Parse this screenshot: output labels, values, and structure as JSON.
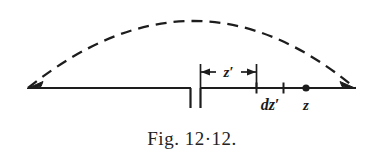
{
  "figure": {
    "caption": "Fig. 12·12.",
    "ink_color": "#1d1d1d",
    "background_color": "#ffffff",
    "labels": {
      "dimension": "z′",
      "increment": "dz′",
      "point": "z"
    },
    "geometry": {
      "baseline_y": 88,
      "baseline_left_x": 28,
      "baseline_right_x": 355,
      "gap_left_x": 190,
      "gap_right_x": 200,
      "gap_tick_depth": 20,
      "arc_apex_x": 195,
      "arc_apex_y": 14,
      "dimension_line_y": 72,
      "dimension_left_x": 200,
      "dimension_right_x": 257,
      "tick_dzprime_left_x": 256,
      "tick_dzprime_right_x": 283,
      "tick_height": 11,
      "point_z_x": 306,
      "point_z_radius": 3.6
    }
  }
}
